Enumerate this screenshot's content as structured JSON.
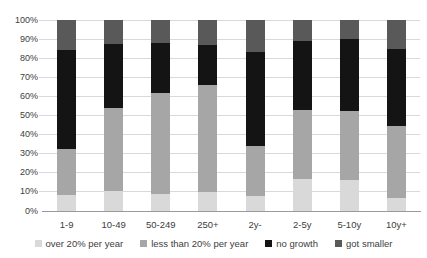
{
  "chart_data": {
    "type": "bar",
    "subtype": "stacked-100-percent",
    "title": "",
    "xlabel": "",
    "ylabel": "",
    "ylim": [
      0,
      100
    ],
    "grid": true,
    "legend_position": "bottom",
    "yticks": [
      "0%",
      "10%",
      "20%",
      "30%",
      "40%",
      "50%",
      "60%",
      "70%",
      "80%",
      "90%",
      "100%"
    ],
    "categories": [
      "1-9",
      "10-49",
      "50-249",
      "250+",
      "2y-",
      "2-5y",
      "5-10y",
      "10y+"
    ],
    "series": [
      {
        "name": "over 20% per year",
        "color": "#d9d9d9",
        "values": [
          8.5,
          10.5,
          9,
          10,
          8,
          17,
          16,
          7
        ]
      },
      {
        "name": "less than 20% per year",
        "color": "#a6a6a6",
        "values": [
          24,
          43.5,
          53,
          56,
          26,
          36,
          36.5,
          37.5
        ]
      },
      {
        "name": "no growth",
        "color": "#141414",
        "values": [
          52,
          33.5,
          26,
          21,
          49.5,
          36,
          37.5,
          40.5
        ]
      },
      {
        "name": "got smaller",
        "color": "#595959",
        "values": [
          15.5,
          12.5,
          12,
          13,
          16.5,
          11,
          10,
          15
        ]
      }
    ]
  },
  "style": {
    "gridline_color": "#d9d9d9",
    "axis_line_color": "#9a9a9a",
    "tick_text_color": "#404040",
    "background": "#ffffff"
  }
}
